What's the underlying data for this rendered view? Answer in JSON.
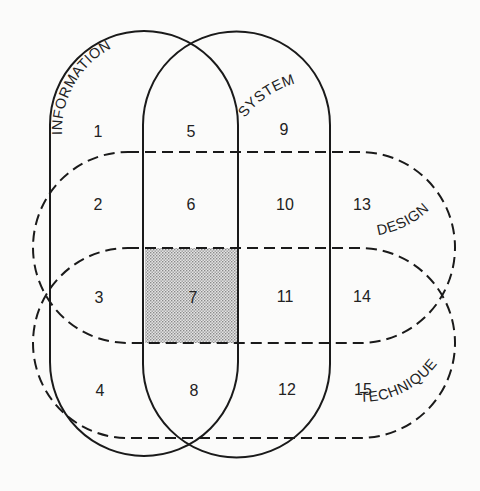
{
  "diagram": {
    "sets": [
      {
        "name": "INFORMATION",
        "style": "solid"
      },
      {
        "name": "SYSTEM",
        "style": "solid"
      },
      {
        "name": "DESIGN",
        "style": "dashed"
      },
      {
        "name": "TECHNIQUE",
        "style": "dashed"
      }
    ],
    "regions": [
      "1",
      "2",
      "3",
      "4",
      "5",
      "6",
      "7",
      "8",
      "9",
      "10",
      "11",
      "12",
      "13",
      "14",
      "15"
    ],
    "highlighted_region": "7",
    "colors": {
      "line": "#1a1a1a",
      "background": "#fbfbfa",
      "shade": "#c9c9c9"
    }
  }
}
